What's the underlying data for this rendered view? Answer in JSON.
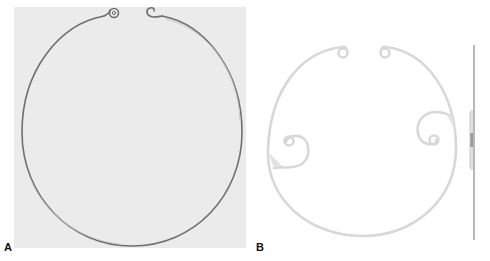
{
  "figure": {
    "panels": [
      {
        "id": "A",
        "label": "A",
        "description": "Open ring with two small curled eyelets at the top gap, photographed on light gray background"
      },
      {
        "id": "B",
        "label": "B",
        "description": "Line drawing of open ring with two top eyelets and two inward-curling side haptics, plus side profile view"
      }
    ]
  },
  "colors": {
    "panel_a_background": "#ebebeb",
    "ring_a_stroke": "#6f6f6f",
    "ring_b_stroke": "#d8d8d8",
    "profile_stroke": "#9a9a9a",
    "label": "#111111"
  }
}
